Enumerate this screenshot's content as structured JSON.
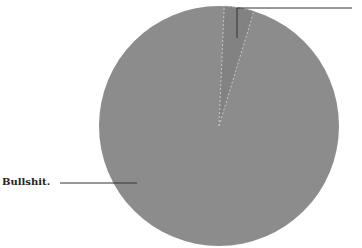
{
  "chart_data": {
    "type": "pie",
    "title": "",
    "slices": [
      {
        "label": "Bullshit.",
        "value": 96,
        "color": "#8c8c8c"
      },
      {
        "label": "",
        "value": 4,
        "color": "#828282"
      }
    ],
    "start_angle_deg": 2.5,
    "legend": "none",
    "annotations": [
      {
        "text": "Bullshit.",
        "position": "left",
        "leader_line": true
      },
      {
        "text": "",
        "position": "top-right",
        "leader_line": true,
        "note": "label cropped out of frame"
      }
    ]
  },
  "labels": {
    "main": "Bullshit."
  },
  "colors": {
    "main_slice": "#8c8c8c",
    "small_slice": "#828282",
    "slice_border": "#c8c8c8",
    "leader_line": "#333333"
  }
}
